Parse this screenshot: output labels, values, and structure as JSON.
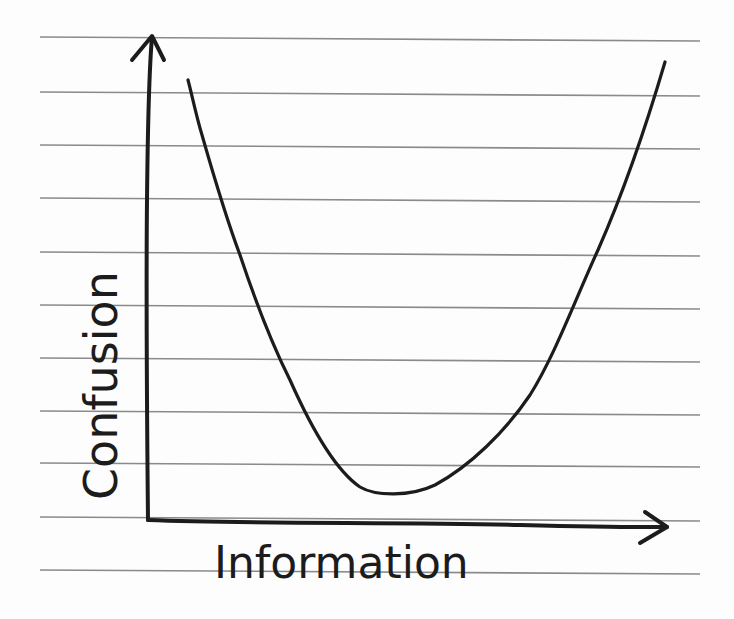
{
  "chart_data": {
    "type": "line",
    "title": "",
    "style": "hand-drawn sketch on ruled notebook paper",
    "xlabel": "Information",
    "ylabel": "Confusion",
    "x_ticks": [],
    "y_ticks": [],
    "grid": false,
    "legend": null,
    "series": [
      {
        "name": "Confusion vs Information",
        "shape": "U-shaped curve (high confusion at low and high information, minimum at moderate information)",
        "x": [
          0.07,
          0.1,
          0.14,
          0.18,
          0.22,
          0.26,
          0.3,
          0.35,
          0.41,
          0.48,
          0.56,
          0.66,
          0.74,
          0.8,
          0.86,
          0.91,
          0.95,
          1.0
        ],
        "y": [
          0.91,
          0.83,
          0.67,
          0.56,
          0.45,
          0.33,
          0.23,
          0.14,
          0.07,
          0.05,
          0.08,
          0.17,
          0.25,
          0.41,
          0.55,
          0.66,
          0.77,
          0.95
        ]
      }
    ],
    "xlim": [
      0,
      1
    ],
    "ylim": [
      0,
      1
    ],
    "annotations": []
  },
  "labels": {
    "x_axis": "Information",
    "y_axis": "Confusion"
  },
  "colors": {
    "ink": "#1c1c1c",
    "ruled_line": "#8a8a8a",
    "paper": "#fdfdfd"
  },
  "paper_rules_y": [
    37,
    92,
    145,
    198,
    252,
    305,
    358,
    411,
    463,
    517,
    570
  ]
}
